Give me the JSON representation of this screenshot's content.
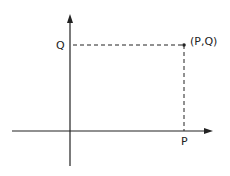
{
  "diagram": {
    "type": "coordinate-plane",
    "axes": {
      "x_label": "P",
      "y_label": "Q"
    },
    "point": {
      "label": "(P,Q)",
      "x_name": "P",
      "y_name": "Q"
    },
    "guides": "dashed projection lines from point to both axes",
    "colors": {
      "ink": "#222222",
      "background": "#ffffff"
    }
  }
}
